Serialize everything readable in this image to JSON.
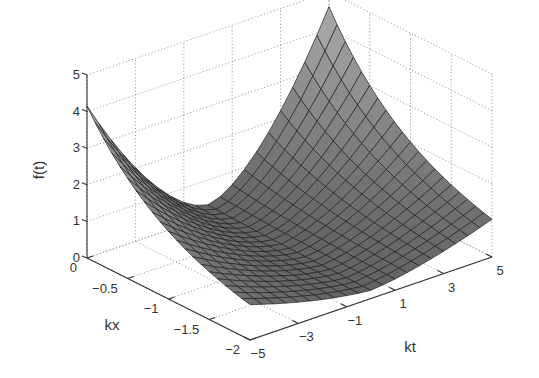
{
  "chart_data": {
    "type": "surface3d",
    "title": "",
    "xlabel": "kt",
    "ylabel": "kx",
    "zlabel": "f(t)",
    "x_ticks": [
      "-5",
      "-3",
      "-1",
      "1",
      "3",
      "5"
    ],
    "y_ticks": [
      "0",
      "-0.5",
      "-1",
      "-1.5",
      "-2"
    ],
    "z_ticks": [
      "0",
      "1",
      "2",
      "3",
      "4",
      "5"
    ],
    "xlim": [
      -5,
      5
    ],
    "ylim": [
      -2,
      0
    ],
    "zlim": [
      0,
      5
    ],
    "grid": true,
    "colormap": "gray",
    "mesh": {
      "kt_steps": 20,
      "kx_steps": 20
    },
    "surface_description": "f = exp(kx) * cosh-like growth in kt; corner values approx: (kt=-5,kx=0)=4.15, (kt=5,kx=0)=4.6 (rendered peak near top), (kt=-5,kx=-2)=0.56, (kt=5,kx=-2)=0.62, minimum near kt=0",
    "corner_values": [
      {
        "kt": -5,
        "kx": 0,
        "f": 4.15
      },
      {
        "kt": 5,
        "kx": 0,
        "f": 4.6
      },
      {
        "kt": -5,
        "kx": -2,
        "f": 0.56
      },
      {
        "kt": 5,
        "kx": -2,
        "f": 0.62
      }
    ]
  },
  "labels": {
    "z_axis": "f(t)",
    "kx_axis": "kx",
    "kt_axis": "kt"
  }
}
